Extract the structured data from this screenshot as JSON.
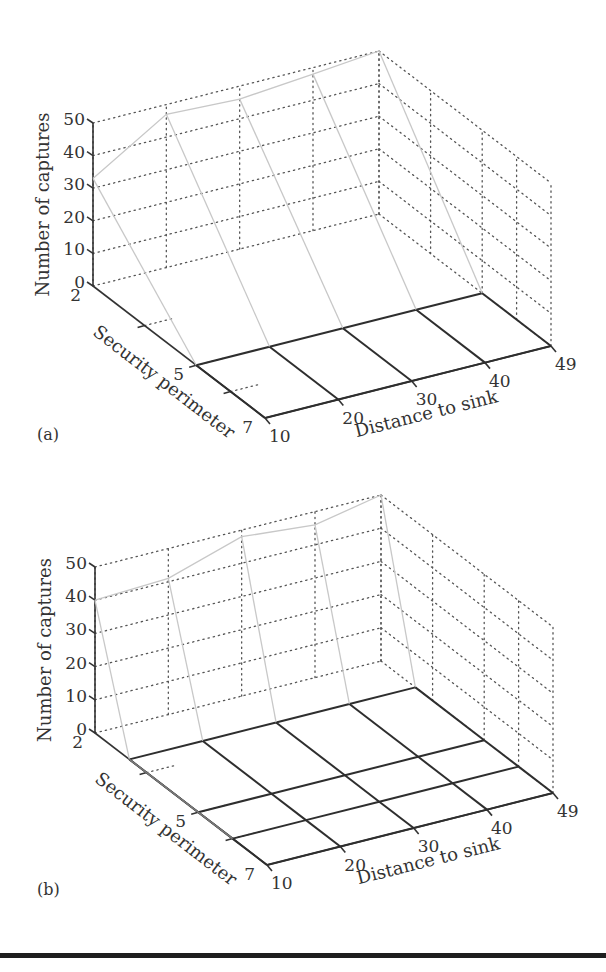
{
  "figure": {
    "bottom_rule": true
  },
  "chart_data": [
    {
      "panel_label": "(a)",
      "type": "surface3d",
      "zlabel": "Number of captures",
      "ylabel": "Security perimeter",
      "xlabel": "Distance to sink",
      "z_ticks": [
        "0",
        "10",
        "20",
        "30",
        "40",
        "50"
      ],
      "y_ticks": [
        "2",
        "5",
        "7"
      ],
      "x_ticks": [
        "10",
        "20",
        "30",
        "40",
        "49"
      ],
      "zlim": [
        0,
        50
      ],
      "grid": true,
      "x": [
        10,
        20,
        30,
        40,
        49
      ],
      "y": [
        2,
        5,
        7
      ],
      "z": [
        [
          33,
          47,
          46,
          48,
          50
        ],
        [
          0,
          0,
          0,
          0,
          0
        ],
        [
          0,
          0,
          0,
          0,
          0
        ]
      ]
    },
    {
      "panel_label": "(b)",
      "type": "surface3d",
      "zlabel": "Number of captures",
      "ylabel": "Security perimeter",
      "xlabel": "Distance to sink",
      "z_ticks": [
        "0",
        "10",
        "20",
        "30",
        "40",
        "50"
      ],
      "y_ticks": [
        "2",
        "5",
        "7"
      ],
      "x_ticks": [
        "10",
        "20",
        "30",
        "40",
        "49"
      ],
      "zlim": [
        0,
        50
      ],
      "grid": true,
      "x": [
        10,
        20,
        30,
        40,
        49
      ],
      "y": [
        2,
        3,
        5,
        6,
        7
      ],
      "z": [
        [
          40,
          41,
          48,
          46,
          50
        ],
        [
          0,
          0,
          0,
          0,
          0
        ],
        [
          0,
          0,
          0,
          0,
          0
        ],
        [
          0,
          0,
          0,
          0,
          0
        ],
        [
          0,
          0,
          0,
          0,
          0
        ]
      ]
    }
  ]
}
